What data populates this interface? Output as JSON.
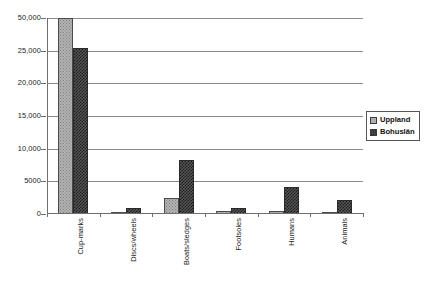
{
  "chart_data": {
    "type": "bar",
    "title": "",
    "subtitle": "",
    "xlabel": "",
    "ylabel": "",
    "grid": true,
    "legend_position": "right",
    "categories": [
      "Cup-marks",
      "Discs/wheels",
      "Boats/sledges",
      "Footsoles",
      "Humans",
      "Animals"
    ],
    "y_tick_labels": [
      "50,000",
      "25,000",
      "20,000",
      "15,000",
      "10,000",
      "5000",
      "0"
    ],
    "y_tick_values": [
      50000,
      25000,
      20000,
      15000,
      10000,
      5000,
      0
    ],
    "ylim": [
      0,
      50000
    ],
    "series": [
      {
        "name": "Uppland",
        "color": "#b4b4b4",
        "pattern": "dotted",
        "values": [
          50000,
          300,
          2400,
          400,
          500,
          300
        ]
      },
      {
        "name": "Bohuslän",
        "color": "#555555",
        "pattern": "cross-hatch",
        "values": [
          27000,
          900,
          8200,
          900,
          4200,
          2200
        ]
      }
    ]
  },
  "legend": {
    "items": [
      {
        "label": "Uppland"
      },
      {
        "label": "Bohuslän"
      }
    ]
  }
}
